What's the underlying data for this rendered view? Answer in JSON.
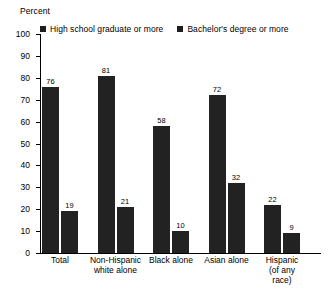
{
  "chart_data": {
    "type": "bar",
    "title": "",
    "ylabel": "Percent",
    "xlabel": "",
    "ylim": [
      0,
      100
    ],
    "yticks": [
      0,
      10,
      20,
      30,
      40,
      50,
      60,
      70,
      80,
      90,
      100
    ],
    "ytick_labels": [
      "0",
      "10",
      "20",
      "30",
      "40",
      "50",
      "60",
      "70",
      "80",
      "90",
      "100"
    ],
    "grid": false,
    "legend_position": "top",
    "categories": [
      "Total",
      "Non-Hispanic\nwhite alone",
      "Black alone",
      "Asian alone",
      "Hispanic\n(of any race)"
    ],
    "series": [
      {
        "name": "High school graduate or more",
        "color": "#222222",
        "values": [
          76,
          81,
          58,
          72,
          22
        ]
      },
      {
        "name": "Bachelor's degree or more",
        "color": "#222222",
        "values": [
          19,
          21,
          10,
          32,
          9
        ]
      }
    ]
  },
  "legend": {
    "entries": [
      {
        "label": "High school graduate or more",
        "swatch": "legend-swatch-high-school"
      },
      {
        "label": "Bachelor's degree or more",
        "swatch": "legend-swatch-bachelors"
      }
    ]
  }
}
